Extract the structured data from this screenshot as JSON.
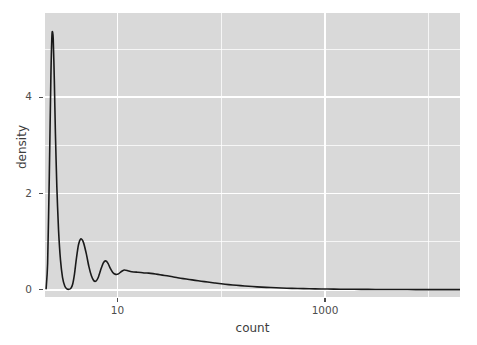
{
  "chart_data": {
    "type": "line",
    "title": "",
    "subtitle": "",
    "xlabel": "count",
    "ylabel": "density",
    "x_scale": "log10",
    "y_scale": "linear",
    "xlim": [
      2.0,
      20000.0
    ],
    "ylim": [
      -0.15,
      5.75
    ],
    "grid": true,
    "legend": null,
    "legend_position": "none",
    "x_tick_labels": [
      "10",
      "1000"
    ],
    "x_tick_values": [
      10,
      1000
    ],
    "x_minor_gridlines": [
      100,
      10000
    ],
    "y_tick_labels": [
      "0",
      "2",
      "4"
    ],
    "y_tick_values": [
      0,
      2,
      4
    ],
    "y_minor_gridlines": [
      1,
      3,
      5
    ],
    "series": [
      {
        "name": "density",
        "color": "#1a1a1a",
        "line_width": 1.6,
        "x": [
          2.05,
          2.12,
          2.2,
          2.28,
          2.34,
          2.4,
          2.46,
          2.52,
          2.6,
          2.7,
          2.82,
          2.95,
          3.1,
          3.25,
          3.4,
          3.55,
          3.7,
          3.85,
          4.0,
          4.2,
          4.45,
          4.7,
          5.0,
          5.3,
          5.6,
          5.9,
          6.2,
          6.5,
          6.9,
          7.3,
          7.7,
          8.1,
          8.5,
          9.0,
          9.6,
          10.2,
          10.9,
          11.6,
          12.4,
          13.3,
          14.3,
          15.5,
          16.8,
          18.3,
          20.0,
          22.0,
          24.5,
          27.0,
          30.0,
          34.0,
          38.0,
          43.0,
          49.0,
          56.0,
          64.0,
          74.0,
          86.0,
          100.0,
          118.0,
          140.0,
          168.0,
          200.0,
          245.0,
          300.0,
          380.0,
          480.0,
          620.0,
          800.0,
          1050.0,
          1400.0,
          1900.0,
          2600.0,
          3600.0,
          5200.0,
          7500.0,
          11000.0,
          16000.0,
          20000.0
        ],
        "y": [
          0.02,
          0.55,
          2.35,
          4.45,
          5.33,
          5.22,
          4.35,
          3.25,
          2.15,
          1.25,
          0.62,
          0.26,
          0.08,
          0.02,
          0.01,
          0.03,
          0.12,
          0.33,
          0.62,
          0.93,
          1.06,
          0.98,
          0.75,
          0.48,
          0.29,
          0.19,
          0.18,
          0.25,
          0.42,
          0.56,
          0.6,
          0.55,
          0.45,
          0.36,
          0.32,
          0.33,
          0.38,
          0.41,
          0.4,
          0.38,
          0.37,
          0.365,
          0.36,
          0.35,
          0.345,
          0.335,
          0.32,
          0.305,
          0.29,
          0.27,
          0.25,
          0.232,
          0.214,
          0.196,
          0.178,
          0.16,
          0.142,
          0.124,
          0.108,
          0.093,
          0.079,
          0.067,
          0.056,
          0.046,
          0.037,
          0.03,
          0.024,
          0.019,
          0.015,
          0.012,
          0.0095,
          0.0075,
          0.006,
          0.005,
          0.004,
          0.0035,
          0.003,
          0.003
        ]
      }
    ],
    "theme": {
      "panel_background": "#d9d9d9",
      "gridline_color": "#ffffff",
      "axis_text_color": "#4d4d4d",
      "axis_title_color": "#3d3d3d",
      "plot_background": "#ffffff"
    }
  },
  "axes": {
    "y_title": "density",
    "x_title": "count",
    "y_ticks": [
      {
        "label": "0",
        "value": 0
      },
      {
        "label": "2",
        "value": 2
      },
      {
        "label": "4",
        "value": 4
      }
    ],
    "x_ticks": [
      {
        "label": "10",
        "value": 10
      },
      {
        "label": "1000",
        "value": 1000
      }
    ]
  }
}
